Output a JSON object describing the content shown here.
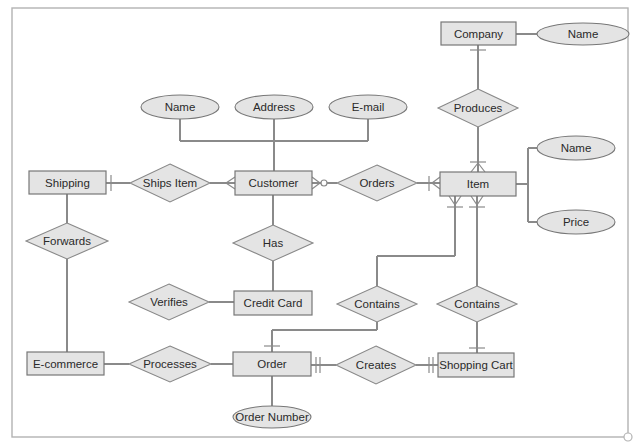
{
  "diagram": {
    "type": "entity-relationship (crow's foot notation)",
    "entities": [
      {
        "id": "company",
        "label": "Company"
      },
      {
        "id": "shipping",
        "label": "Shipping"
      },
      {
        "id": "customer",
        "label": "Customer"
      },
      {
        "id": "item",
        "label": "Item"
      },
      {
        "id": "credit_card",
        "label": "Credit Card"
      },
      {
        "id": "ecommerce",
        "label": "E-commerce"
      },
      {
        "id": "order",
        "label": "Order"
      },
      {
        "id": "shopping_cart",
        "label": "Shopping Cart"
      }
    ],
    "relationships": [
      {
        "id": "produces",
        "label": "Produces",
        "from": "Company",
        "to": "Item"
      },
      {
        "id": "ships_item",
        "label": "Ships Item",
        "from": "Shipping",
        "to": "Customer"
      },
      {
        "id": "orders",
        "label": "Orders",
        "from": "Customer",
        "to": "Item"
      },
      {
        "id": "forwards",
        "label": "Forwards",
        "from": "Shipping",
        "to": "E-commerce"
      },
      {
        "id": "has",
        "label": "Has",
        "from": "Customer",
        "to": "Credit Card"
      },
      {
        "id": "verifies",
        "label": "Verifies",
        "from": "Credit Card",
        "to": ""
      },
      {
        "id": "contains_order",
        "label": "Contains",
        "from": "Order",
        "to": "Item"
      },
      {
        "id": "contains_cart",
        "label": "Contains",
        "from": "Shopping Cart",
        "to": "Item"
      },
      {
        "id": "processes",
        "label": "Processes",
        "from": "E-commerce",
        "to": "Order"
      },
      {
        "id": "creates",
        "label": "Creates",
        "from": "Order",
        "to": "Shopping Cart"
      }
    ],
    "attributes": [
      {
        "id": "company_name",
        "label": "Name",
        "of": "Company"
      },
      {
        "id": "customer_name",
        "label": "Name",
        "of": "Customer"
      },
      {
        "id": "customer_address",
        "label": "Address",
        "of": "Customer"
      },
      {
        "id": "customer_email",
        "label": "E-mail",
        "of": "Customer"
      },
      {
        "id": "item_name",
        "label": "Name",
        "of": "Item"
      },
      {
        "id": "item_price",
        "label": "Price",
        "of": "Item"
      },
      {
        "id": "order_number",
        "label": "Order Number",
        "of": "Order"
      }
    ]
  },
  "labels": {
    "company": "Company",
    "company_name": "Name",
    "produces": "Produces",
    "customer_name": "Name",
    "customer_address": "Address",
    "customer_email": "E-mail",
    "item_name": "Name",
    "item_price": "Price",
    "shipping": "Shipping",
    "ships_item": "Ships Item",
    "customer": "Customer",
    "orders": "Orders",
    "item": "Item",
    "forwards": "Forwards",
    "has": "Has",
    "verifies": "Verifies",
    "credit_card": "Credit Card",
    "contains_left": "Contains",
    "contains_right": "Contains",
    "ecommerce": "E-commerce",
    "processes": "Processes",
    "order": "Order",
    "creates": "Creates",
    "shopping_cart": "Shopping Cart",
    "order_number": "Order Number"
  },
  "colors": {
    "shape_fill": "#e4e4e4",
    "shape_stroke": "#777777",
    "connector": "#8a8a8a",
    "frame": "#b3b3b3",
    "text": "#2a2a2a"
  }
}
